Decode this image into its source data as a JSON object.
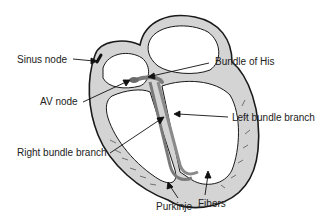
{
  "diagram": {
    "labels": {
      "sinus_node": "Sinus node",
      "av_node": "AV node",
      "bundle_of_his": "Bundle of His",
      "left_bundle_branch": "Left bundle branch",
      "right_bundle_branch": "Right bundle branch",
      "purkinje": "Purkinje",
      "fibers": "Fibers"
    },
    "colors": {
      "wall_fill": "#d4d4d4",
      "outline": "#1a1a1a",
      "conduction": "#7a7a7a",
      "background": "#ffffff"
    }
  }
}
